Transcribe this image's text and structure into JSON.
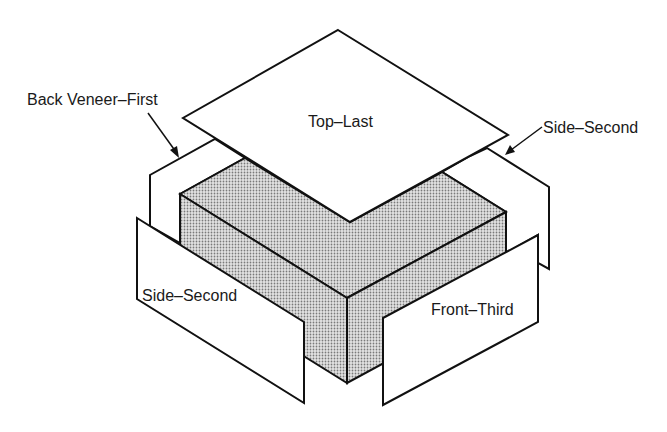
{
  "diagram": {
    "colors": {
      "line": "#111111",
      "panel_fill": "#ffffff",
      "core_fill": "#cfcfcf",
      "core_dot": "#7a7a7a",
      "background": "#ffffff"
    },
    "labels": {
      "back_veneer": "Back Veneer–First",
      "top": "Top–Last",
      "side_right": "Side–Second",
      "side_left": "Side–Second",
      "front": "Front–Third"
    },
    "parts": [
      {
        "id": "back",
        "label": "Back Veneer–First",
        "order": 1
      },
      {
        "id": "side_left",
        "label": "Side–Second",
        "order": 2
      },
      {
        "id": "side_right",
        "label": "Side–Second",
        "order": 2
      },
      {
        "id": "front",
        "label": "Front–Third",
        "order": 3
      },
      {
        "id": "top",
        "label": "Top–Last",
        "order": 4
      }
    ]
  }
}
